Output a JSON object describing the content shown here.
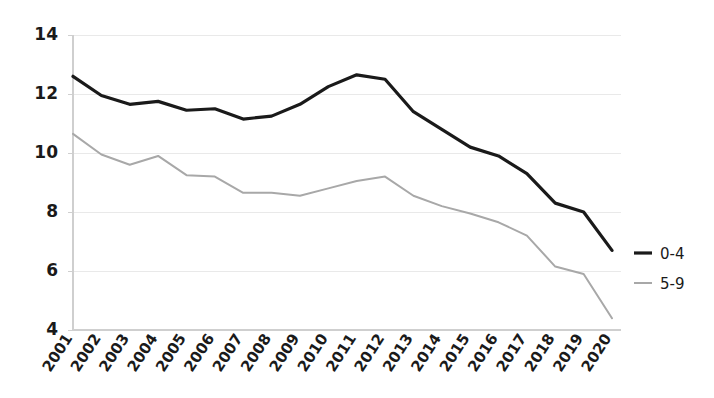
{
  "chart_data": {
    "type": "line",
    "title": "",
    "subtitle": "",
    "xlabel": "",
    "ylabel": "",
    "categories": [
      "2001",
      "2002",
      "2003",
      "2004",
      "2005",
      "2006",
      "2007",
      "2008",
      "2009",
      "2010",
      "2011",
      "2012",
      "2013",
      "2014",
      "2015",
      "2016",
      "2017",
      "2018",
      "2019",
      "2020"
    ],
    "series": [
      {
        "name": "0-4",
        "color": "#1a1a1a",
        "values": [
          12.6,
          11.95,
          11.65,
          11.75,
          11.45,
          11.5,
          11.15,
          11.25,
          11.65,
          12.25,
          12.65,
          12.5,
          11.4,
          10.8,
          10.2,
          9.9,
          9.3,
          8.3,
          8.0,
          6.7
        ]
      },
      {
        "name": "5-9",
        "color": "#a8a8a8",
        "values": [
          10.65,
          9.95,
          9.6,
          9.9,
          9.25,
          9.2,
          8.65,
          8.65,
          8.55,
          8.8,
          9.05,
          9.2,
          8.55,
          8.2,
          7.95,
          7.65,
          7.2,
          6.15,
          5.9,
          4.4
        ]
      }
    ],
    "ylim": [
      4,
      14
    ],
    "yticks": [
      4,
      6,
      8,
      10,
      12,
      14
    ],
    "ytick_labels": [
      "4",
      "6",
      "8",
      "10",
      "12",
      "14"
    ],
    "xlim": [
      "2001",
      "2020"
    ],
    "grid": true,
    "grid_color": "#e9e9e9",
    "axis_color": "#cfcfcf",
    "background": "#ffffff",
    "legend_position": "right",
    "legend_entries": [
      {
        "label": "0-4",
        "color": "#1a1a1a"
      },
      {
        "label": "5-9",
        "color": "#a8a8a8"
      }
    ]
  }
}
